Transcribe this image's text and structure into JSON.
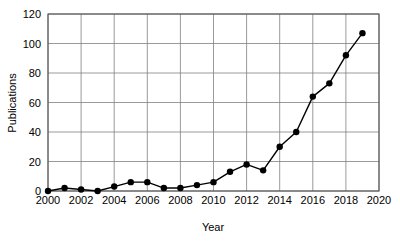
{
  "chart_data": {
    "type": "line",
    "title": "",
    "xlabel": "Year",
    "ylabel": "Publications",
    "xlim": [
      2000,
      2020
    ],
    "ylim": [
      0,
      120
    ],
    "grid": true,
    "legend": false,
    "x": [
      2000,
      2001,
      2002,
      2003,
      2004,
      2005,
      2006,
      2007,
      2008,
      2009,
      2010,
      2011,
      2012,
      2013,
      2014,
      2015,
      2016,
      2017,
      2018,
      2019
    ],
    "values": [
      0,
      2,
      1,
      0,
      3,
      6,
      6,
      2,
      2,
      4,
      6,
      13,
      18,
      14,
      30,
      40,
      64,
      73,
      92,
      107
    ],
    "series": [
      {
        "name": "Publications",
        "values": [
          0,
          2,
          1,
          0,
          3,
          6,
          6,
          2,
          2,
          4,
          6,
          13,
          18,
          14,
          30,
          40,
          64,
          73,
          92,
          107
        ]
      }
    ],
    "x_tick_labels": [
      "2000",
      "2002",
      "2004",
      "2006",
      "2008",
      "2010",
      "2012",
      "2014",
      "2016",
      "2018",
      "2020"
    ],
    "x_tick_values": [
      2000,
      2002,
      2004,
      2006,
      2008,
      2010,
      2012,
      2014,
      2016,
      2018,
      2020
    ],
    "y_tick_labels": [
      "0",
      "20",
      "40",
      "60",
      "80",
      "100",
      "120"
    ],
    "y_tick_values": [
      0,
      20,
      40,
      60,
      80,
      100,
      120
    ],
    "colors": {
      "line": "#000000",
      "marker": "#000000",
      "grid": "#808080",
      "axis": "#555555",
      "background": "#ffffff"
    },
    "marker": "circle",
    "line_width": 1.4,
    "marker_size": 3.2
  }
}
